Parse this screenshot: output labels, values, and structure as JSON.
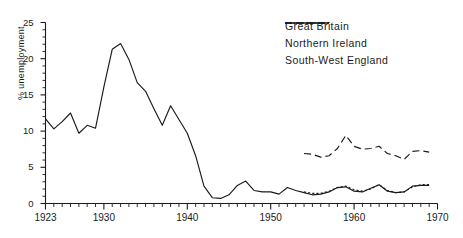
{
  "chart_data": {
    "type": "line",
    "title": "",
    "xlabel": "",
    "ylabel": "% unemployment",
    "xlim": [
      1923,
      1970
    ],
    "ylim": [
      0,
      25
    ],
    "grid": false,
    "legend_position": "top-right",
    "y_ticks": [
      0,
      5,
      10,
      15,
      20,
      25
    ],
    "y_tick_labels": [
      "0",
      "5",
      "10",
      "15",
      "20",
      "25"
    ],
    "y_minor_tick_step": 1,
    "x_ticks": [
      1923,
      1930,
      1940,
      1950,
      1960,
      1970
    ],
    "x_tick_labels": [
      "1923",
      "1930",
      "1940",
      "1950",
      "1960",
      "1970"
    ],
    "x_minor_tick_step": 1,
    "series": [
      {
        "name": "Great Britain",
        "style": "solid",
        "color": "#1a1a1a",
        "x": [
          1923,
          1924,
          1925,
          1926,
          1927,
          1928,
          1929,
          1930,
          1931,
          1932,
          1933,
          1934,
          1935,
          1936,
          1937,
          1938,
          1939,
          1940,
          1941,
          1942,
          1943,
          1944,
          1945,
          1946,
          1947,
          1948,
          1949,
          1950,
          1951,
          1952,
          1953,
          1954,
          1955,
          1956,
          1957,
          1958,
          1959,
          1960,
          1961,
          1962,
          1963,
          1964,
          1965,
          1966,
          1967,
          1968,
          1969
        ],
        "values": [
          11.7,
          10.3,
          11.3,
          12.5,
          9.7,
          10.8,
          10.4,
          16.1,
          21.3,
          22.1,
          19.9,
          16.7,
          15.5,
          13.1,
          10.8,
          13.5,
          11.6,
          9.7,
          6.6,
          2.4,
          0.8,
          0.7,
          1.2,
          2.5,
          3.1,
          1.8,
          1.6,
          1.6,
          1.3,
          2.2,
          1.8,
          1.5,
          1.2,
          1.3,
          1.6,
          2.2,
          2.3,
          1.7,
          1.6,
          2.1,
          2.6,
          1.7,
          1.5,
          1.6,
          2.4,
          2.5,
          2.5
        ]
      },
      {
        "name": "Northern Ireland",
        "style": "dashed",
        "color": "#1a1a1a",
        "x": [
          1954,
          1955,
          1956,
          1957,
          1958,
          1959,
          1960,
          1961,
          1962,
          1963,
          1964,
          1965,
          1966,
          1967,
          1968,
          1969
        ],
        "values": [
          6.9,
          6.8,
          6.4,
          6.6,
          7.6,
          9.4,
          7.9,
          7.5,
          7.6,
          7.9,
          6.9,
          6.6,
          6.1,
          7.2,
          7.3,
          7.1
        ]
      },
      {
        "name": "South-West England",
        "style": "dotted",
        "color": "#1a1a1a",
        "x": [
          1954,
          1955,
          1956,
          1957,
          1958,
          1959,
          1960,
          1961,
          1962,
          1963,
          1964,
          1965,
          1966,
          1967,
          1968,
          1969
        ],
        "values": [
          1.6,
          1.4,
          1.4,
          1.7,
          2.2,
          2.4,
          1.9,
          1.7,
          2.0,
          2.6,
          1.8,
          1.5,
          1.6,
          2.3,
          2.6,
          2.6
        ]
      }
    ]
  },
  "legend": {
    "items": [
      {
        "label": "Great Britain",
        "style": "solid"
      },
      {
        "label": "Northern Ireland",
        "style": "dashed"
      },
      {
        "label": "South-West England",
        "style": "dotted"
      }
    ]
  },
  "axes": {
    "y_title": "% unemployment"
  }
}
